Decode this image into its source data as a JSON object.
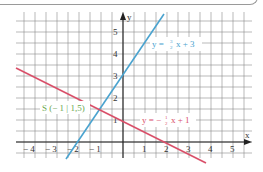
{
  "chart_data": {
    "type": "line",
    "title": "",
    "xlabel": "x",
    "ylabel": "y",
    "xlim": [
      -4.8,
      5.9
    ],
    "ylim": [
      -0.7,
      5.9
    ],
    "grid": true,
    "x_ticks": [
      "-4",
      "-3",
      "-2",
      "-1",
      "1",
      "2",
      "3",
      "4",
      "5"
    ],
    "y_ticks": [
      "1",
      "2",
      "3",
      "4",
      "5"
    ],
    "series": [
      {
        "name": "y = 3/2 x + 3",
        "color": "#4aa3cf",
        "slope": 1.5,
        "intercept": 3,
        "x_range": [
          -2.4,
          1.9
        ]
      },
      {
        "name": "y = -1/2 x + 1",
        "color": "#d9506a",
        "slope": -0.5,
        "intercept": 1,
        "x_range": [
          -4.8,
          3.8
        ]
      }
    ],
    "annotations": [
      {
        "text": "S (-1 | 1,5)",
        "x": -1,
        "y": 1.5,
        "color": "#6aa84f"
      }
    ]
  },
  "labels": {
    "x_axis": "x",
    "y_axis": "y",
    "x_ticks": [
      "− 4",
      "− 3",
      "− 2",
      "− 1",
      "1",
      "2",
      "3",
      "4",
      "5"
    ],
    "y_ticks": [
      "1",
      "2",
      "3",
      "4",
      "5"
    ],
    "blue_eq_prefix": "y = ",
    "blue_eq_num": "3",
    "blue_eq_den": "2",
    "blue_eq_suffix": "x + 3",
    "red_eq_prefix": "y = − ",
    "red_eq_num": "1",
    "red_eq_den": "2",
    "red_eq_suffix": "x + 1",
    "point": "S (− 1 | 1,5)"
  }
}
